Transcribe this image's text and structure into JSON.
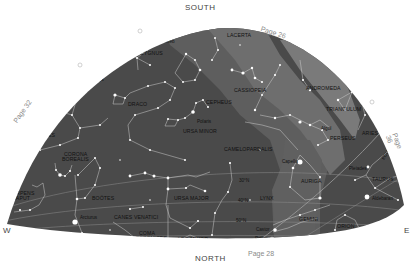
{
  "compass": {
    "south": "SOUTH",
    "north": "NORTH",
    "west": "W",
    "east": "E"
  },
  "page_refs": {
    "top": "Page 26",
    "left": "Page 32",
    "right": "Page 36",
    "bottom": "Page 28"
  },
  "constellations": {
    "lyra": "LYRA",
    "cygnus": "CYGNUS",
    "lacerta": "LACERTA",
    "draco": "DRACO",
    "cepheus": "CEPHEUS",
    "cassiopeia": "CASSIOPEIA",
    "andromeda": "ANDROMEDA",
    "triangulum": "TRIANGULUM",
    "hercules": "HERCULES",
    "ursa_minor": "URSA MINOR",
    "perseus": "PERSEUS",
    "aries": "ARIES",
    "corona_borealis_1": "CORONA",
    "corona_borealis_2": "BOREALIS",
    "camelopardalis": "CAMELOPARDALIS",
    "serpens_caput_1": "SERPENS",
    "serpens_caput_2": "CAPUT",
    "bootes": "BOÖTES",
    "ursa_major": "URSA MAJOR",
    "lynx": "LYNX",
    "auriga": "AURIGA",
    "taurus": "TAURUS",
    "canes_venatici": "CANES VENATICI",
    "gemini": "GEMINI",
    "orion": "ORION",
    "coma_berenices_1": "COMA",
    "coma_berenices_2": "BERENICES",
    "leo_minor": "LEO MINOR"
  },
  "stars": {
    "deneb": "Deneb",
    "vega": "Vega",
    "polaris": "Polaris",
    "algol": "Algol",
    "capella": "Capella",
    "pleiades": "Pleiades",
    "aldebaran": "Aldebaran",
    "arcturus": "Arcturus",
    "castor": "Castor",
    "pollux": "Pollux"
  },
  "other_labels": {
    "ecliptic": "ECLIPTIC"
  },
  "declination_labels": [
    "30°N",
    "40°N",
    "50°N",
    "60°N"
  ],
  "colors": {
    "sky": "#4a4a4a",
    "milky_way": "#6e6e6e",
    "milky_way_light": "#858585",
    "lines": "#cfcfcf",
    "stars": "#ffffff",
    "page_text": "#8a8a8a"
  }
}
